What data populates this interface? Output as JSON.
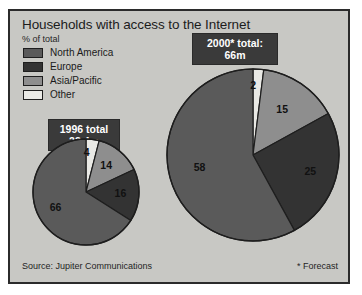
{
  "header": {
    "title": "Households with access to the Internet",
    "subtitle": "% of total"
  },
  "legend": {
    "items": [
      {
        "label": "North America",
        "color": "#5a5a5a",
        "name": "legend-north-america"
      },
      {
        "label": "Europe",
        "color": "#333333",
        "name": "legend-europe"
      },
      {
        "label": "Asia/Pacific",
        "color": "#8e8e8e",
        "name": "legend-asia-pacific"
      },
      {
        "label": "Other",
        "color": "#e9e9e5",
        "name": "legend-other"
      }
    ]
  },
  "callouts": {
    "pie1996_line1": "1996 total",
    "pie1996_line2": "23.4m",
    "pie2000_line1": "2000* total:",
    "pie2000_line2": "66m"
  },
  "footer": {
    "source": "Source: Jupiter Communications",
    "forecast_note": "* Forecast"
  },
  "chart_data": {
    "type": "pie",
    "title": "Households with access to the Internet",
    "subtitle": "% of total",
    "unit": "% of total",
    "legend_position": "top-left",
    "categories": [
      "North America",
      "Europe",
      "Asia/Pacific",
      "Other"
    ],
    "colors": [
      "#5a5a5a",
      "#333333",
      "#8e8e8e",
      "#e9e9e5"
    ],
    "charts": [
      {
        "name": "1996",
        "label": "1996 total",
        "total": "23.4m",
        "total_value": 23.4,
        "values": [
          66,
          16,
          14,
          4
        ],
        "draw_order": [
          "Other",
          "Asia/Pacific",
          "Europe",
          "North America"
        ],
        "draw_values": [
          4,
          14,
          16,
          66
        ],
        "slice_labels": [
          "66",
          "16",
          "14",
          "4"
        ]
      },
      {
        "name": "2000",
        "label": "2000* total:",
        "total": "66m",
        "total_value": 66,
        "values": [
          58,
          25,
          15,
          2
        ],
        "draw_order": [
          "Other",
          "Asia/Pacific",
          "Europe",
          "North America"
        ],
        "draw_values": [
          2,
          15,
          25,
          58
        ],
        "slice_labels": [
          "58",
          "25",
          "15",
          "2"
        ]
      }
    ],
    "source": "Source: Jupiter Communications",
    "annotation": "* Forecast"
  }
}
